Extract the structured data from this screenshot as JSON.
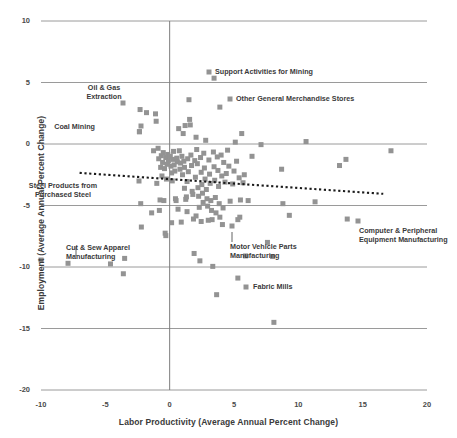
{
  "chart_data": {
    "type": "scatter",
    "title": "",
    "xlabel": "Labor Productivity (Average Annual Percent Change)",
    "ylabel": "Employment (Average Annual Percent Change)",
    "xlim": [
      -10,
      20
    ],
    "ylim": [
      -20,
      10
    ],
    "xticks": [
      "-10",
      "-5",
      "0",
      "5",
      "10",
      "15",
      "20"
    ],
    "xtick_values": [
      -10,
      -5,
      0,
      5,
      10,
      15,
      20
    ],
    "yticks": [
      "10",
      "5",
      "0",
      "-5",
      "-10",
      "-15",
      "-20"
    ],
    "ytick_values": [
      10,
      5,
      0,
      -5,
      -10,
      -15,
      -20
    ],
    "grid": "horizontal gridlines at every y tick; vertical axis line at x=0",
    "legend": "none",
    "marker": {
      "shape": "square",
      "color": "#939393",
      "size_px": 5
    },
    "trendline": {
      "style": "dotted",
      "color": "#1a1a1a",
      "x_start": -7.0,
      "y_start": -2.35,
      "x_end": 16.6,
      "y_end": -4.05,
      "note": "slightly downward-sloping dotted linear trend"
    },
    "points": [
      [
        -7.9,
        -9.7
      ],
      [
        -4.6,
        -9.75
      ],
      [
        -3.6,
        -10.55
      ],
      [
        -3.5,
        -9.3
      ],
      [
        -2.3,
        2.8
      ],
      [
        -2.25,
        -4.85
      ],
      [
        -2.2,
        -6.75
      ],
      [
        -1.8,
        2.55
      ],
      [
        -1.4,
        -5.6
      ],
      [
        -1.25,
        -0.55
      ],
      [
        -1.1,
        2.45
      ],
      [
        -1.05,
        1.85
      ],
      [
        -1.0,
        -3.2
      ],
      [
        -0.9,
        -0.35
      ],
      [
        -0.85,
        -1.2
      ],
      [
        -0.8,
        -5.4
      ],
      [
        -0.75,
        -4.55
      ],
      [
        -0.7,
        -1.9
      ],
      [
        -0.65,
        -0.95
      ],
      [
        -0.6,
        -2.6
      ],
      [
        -0.55,
        -1.5
      ],
      [
        -0.5,
        -0.7
      ],
      [
        -0.45,
        -4.6
      ],
      [
        -0.4,
        -2.0
      ],
      [
        -0.35,
        -7.25
      ],
      [
        -0.3,
        -7.45
      ],
      [
        -0.3,
        -1.1
      ],
      [
        -0.25,
        -2.85
      ],
      [
        -0.2,
        -1.65
      ],
      [
        -0.15,
        -0.85
      ],
      [
        -0.1,
        -1.35
      ],
      [
        -2.35,
        1.0
      ],
      [
        0.05,
        -1.0
      ],
      [
        0.1,
        -1.8
      ],
      [
        0.15,
        -2.35
      ],
      [
        0.2,
        -3.0
      ],
      [
        0.25,
        -1.25
      ],
      [
        0.3,
        -0.6
      ],
      [
        0.35,
        -1.7
      ],
      [
        0.4,
        -2.2
      ],
      [
        0.45,
        -4.45
      ],
      [
        0.5,
        -4.6
      ],
      [
        0.55,
        -1.15
      ],
      [
        0.6,
        -1.45
      ],
      [
        0.65,
        -5.3
      ],
      [
        0.7,
        1.25
      ],
      [
        0.75,
        -0.55
      ],
      [
        0.8,
        -2.05
      ],
      [
        0.85,
        -1.55
      ],
      [
        0.9,
        -6.35
      ],
      [
        0.95,
        -1.0
      ],
      [
        1.0,
        -2.5
      ],
      [
        1.05,
        0.85
      ],
      [
        1.1,
        -1.4
      ],
      [
        1.15,
        -1.9
      ],
      [
        1.2,
        1.5
      ],
      [
        1.25,
        -4.5
      ],
      [
        1.3,
        -4.3
      ],
      [
        1.35,
        -3.05
      ],
      [
        1.4,
        -1.2
      ],
      [
        1.45,
        -2.25
      ],
      [
        1.5,
        3.6
      ],
      [
        1.55,
        2.0
      ],
      [
        1.6,
        1.55
      ],
      [
        1.65,
        -0.9
      ],
      [
        1.7,
        -1.75
      ],
      [
        1.75,
        -3.85
      ],
      [
        1.8,
        -4.1
      ],
      [
        1.85,
        -6.1
      ],
      [
        1.9,
        -8.9
      ],
      [
        1.95,
        -1.35
      ],
      [
        2.0,
        -2.7
      ],
      [
        2.05,
        0.55
      ],
      [
        2.1,
        -0.45
      ],
      [
        2.15,
        -1.6
      ],
      [
        2.2,
        -3.55
      ],
      [
        2.25,
        -4.25
      ],
      [
        2.3,
        -5.15
      ],
      [
        2.35,
        -9.5
      ],
      [
        2.4,
        -1.1
      ],
      [
        2.45,
        -2.3
      ],
      [
        2.5,
        -3.3
      ],
      [
        2.55,
        -4.0
      ],
      [
        2.6,
        -4.75
      ],
      [
        2.65,
        -0.75
      ],
      [
        2.7,
        -1.95
      ],
      [
        2.75,
        -2.85
      ],
      [
        2.8,
        0.3
      ],
      [
        2.85,
        -3.7
      ],
      [
        2.9,
        -4.45
      ],
      [
        2.95,
        -5.05
      ],
      [
        3.0,
        -6.2
      ],
      [
        3.05,
        -1.3
      ],
      [
        3.1,
        -2.45
      ],
      [
        3.15,
        -3.2
      ],
      [
        3.2,
        -4.6
      ],
      [
        3.25,
        -5.4
      ],
      [
        3.3,
        -6.15
      ],
      [
        3.35,
        -9.95
      ],
      [
        3.4,
        -0.65
      ],
      [
        3.45,
        -1.85
      ],
      [
        3.5,
        -2.95
      ],
      [
        3.55,
        -4.35
      ],
      [
        3.6,
        -5.6
      ],
      [
        3.65,
        -12.25
      ],
      [
        3.7,
        -1.05
      ],
      [
        3.75,
        -2.15
      ],
      [
        3.8,
        -3.45
      ],
      [
        3.85,
        -4.85
      ],
      [
        3.9,
        -5.95
      ],
      [
        4.0,
        -0.9
      ],
      [
        4.05,
        -2.6
      ],
      [
        4.1,
        -6.55
      ],
      [
        4.15,
        -5.2
      ],
      [
        4.2,
        -1.5
      ],
      [
        4.3,
        -3.1
      ],
      [
        4.4,
        -2.4
      ],
      [
        4.5,
        -0.5
      ],
      [
        4.6,
        -1.8
      ],
      [
        4.7,
        -4.65
      ],
      [
        4.9,
        -3.25
      ],
      [
        5.0,
        -2.2
      ],
      [
        5.1,
        0.15
      ],
      [
        5.2,
        -1.4
      ],
      [
        5.3,
        -6.15
      ],
      [
        5.4,
        -2.75
      ],
      [
        5.45,
        -5.95
      ],
      [
        5.5,
        -4.55
      ],
      [
        5.6,
        0.85
      ],
      [
        5.7,
        -3.15
      ],
      [
        5.8,
        -2.5
      ],
      [
        5.9,
        -9.1
      ],
      [
        6.1,
        -4.6
      ],
      [
        6.4,
        -1.0
      ],
      [
        7.1,
        -0.05
      ],
      [
        7.6,
        -8.0
      ],
      [
        8.0,
        -9.15
      ],
      [
        8.1,
        -14.5
      ],
      [
        8.8,
        -4.85
      ],
      [
        9.3,
        -5.8
      ],
      [
        8.7,
        -2.05
      ],
      [
        10.6,
        0.2
      ],
      [
        11.3,
        -4.7
      ],
      [
        13.2,
        -1.75
      ],
      [
        13.7,
        -1.25
      ],
      [
        13.8,
        -6.1
      ],
      [
        17.2,
        -0.55
      ],
      [
        5.3,
        -10.9
      ],
      [
        3.45,
        5.35
      ],
      [
        3.9,
        3.0
      ],
      [
        -2.35,
        1.0
      ],
      [
        1.35,
        -5.5
      ],
      [
        2.05,
        -5.85
      ],
      [
        2.45,
        -6.3
      ],
      [
        1.15,
        -3.6
      ],
      [
        0.15,
        -6.4
      ]
    ],
    "annotations": [
      {
        "label": "Support Activities for Mining",
        "point": [
          3.45,
          5.35
        ],
        "marker_px": [
          209,
          72
        ],
        "text_px": [
          215,
          68
        ],
        "align": "left",
        "leader": false
      },
      {
        "label": "Oil & Gas\nExtraction",
        "point": [
          -2.3,
          2.8
        ],
        "marker_px": [
          123,
          103
        ],
        "text_px": [
          104,
          84
        ],
        "align": "center",
        "leader": false
      },
      {
        "label": "Other General Merchandise Stores",
        "point": [
          3.9,
          3.0
        ],
        "marker_px": [
          230,
          99
        ],
        "text_px": [
          236,
          95
        ],
        "align": "left",
        "leader": false
      },
      {
        "label": "Coal Mining",
        "point": [
          -2.35,
          1.0
        ],
        "marker_px": [
          141,
          126
        ],
        "text_px": [
          95,
          123
        ],
        "align": "right",
        "leader": false
      },
      {
        "label": "Steel Products from\nPurchased Steel",
        "point": [
          -1.0,
          -3.2
        ],
        "marker_px": [
          139,
          181
        ],
        "text_px": [
          63,
          182
        ],
        "align": "center",
        "leader": false
      },
      {
        "label": "Cut & Sew Apparel\nManufacturing",
        "point": [
          -7.9,
          -9.7
        ],
        "marker_px": [
          41,
          260
        ],
        "text_px": [
          66,
          244
        ],
        "align": "left",
        "leader": true,
        "leader_px": [
          [
            76,
            256
          ],
          [
            76,
            247
          ]
        ]
      },
      {
        "label": "Motor Vehicle Parts\nManufacturing",
        "point": [
          4.1,
          -6.55
        ],
        "marker_px": [
          232,
          226
        ],
        "text_px": [
          230,
          243
        ],
        "align": "left",
        "leader": true,
        "leader_px": [
          [
            232,
            232
          ],
          [
            232,
            242
          ]
        ]
      },
      {
        "label": "Computer & Peripheral\nEquipment Manufacturing",
        "point": [
          13.8,
          -6.1
        ],
        "marker_px": [
          358,
          221
        ],
        "text_px": [
          359,
          227
        ],
        "align": "left",
        "leader": false
      },
      {
        "label": "Fabric Mills",
        "point": [
          5.3,
          -10.9
        ],
        "marker_px": [
          246,
          287
        ],
        "text_px": [
          253,
          283
        ],
        "align": "left",
        "leader": false
      }
    ],
    "colors": {
      "marker": "#939393",
      "gridline": "#9a9a9a",
      "axis_line": "#7d7d7d",
      "trendline": "#1a1a1a",
      "text": "#3a3a3a",
      "background": "#ffffff"
    }
  }
}
